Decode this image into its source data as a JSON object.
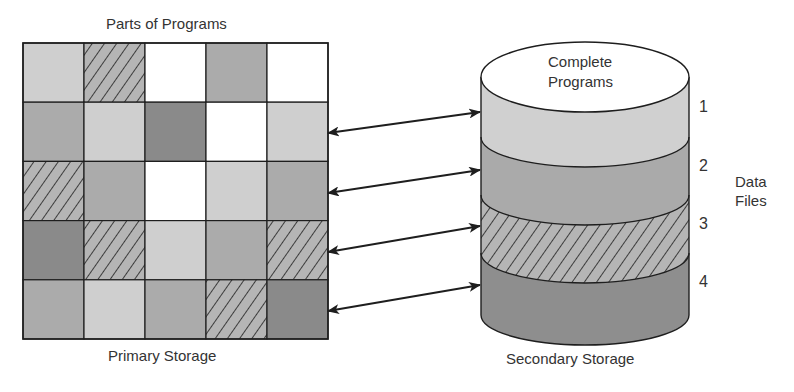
{
  "diagram": {
    "primary": {
      "title_top": "Parts of Programs",
      "title_bottom": "Primary Storage",
      "grid": {
        "rows": 5,
        "cols": 5,
        "cells": [
          [
            "light",
            "hatched",
            "white",
            "medium",
            "white"
          ],
          [
            "medium",
            "light",
            "dark",
            "white",
            "light"
          ],
          [
            "hatched",
            "medium",
            "white",
            "light",
            "medium"
          ],
          [
            "dark",
            "hatched",
            "light",
            "medium",
            "hatched"
          ],
          [
            "medium",
            "light",
            "medium",
            "hatched",
            "dark"
          ]
        ]
      }
    },
    "secondary": {
      "top_label_line1": "Complete",
      "top_label_line2": "Programs",
      "bottom_label": "Secondary Storage",
      "layers": [
        {
          "number": "1",
          "shade": "light"
        },
        {
          "number": "2",
          "shade": "medium"
        },
        {
          "number": "3",
          "shade": "hatched"
        },
        {
          "number": "4",
          "shade": "dark"
        }
      ],
      "side_label_line1": "Data",
      "side_label_line2": "Files"
    },
    "connections": [
      {
        "from": "primary-row-2",
        "to": "layer-1",
        "type": "bidirectional"
      },
      {
        "from": "primary-row-3",
        "to": "layer-2",
        "type": "bidirectional"
      },
      {
        "from": "primary-row-4",
        "to": "layer-3",
        "type": "bidirectional"
      },
      {
        "from": "primary-row-5",
        "to": "layer-4",
        "type": "bidirectional"
      }
    ],
    "colors": {
      "white": "#ffffff",
      "light": "#cfcfcf",
      "medium": "#ababab",
      "dark": "#8a8a8a",
      "hatched_bg": "#b5b5b5",
      "line": "#1e1e1e"
    }
  }
}
